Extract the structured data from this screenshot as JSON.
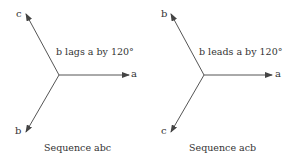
{
  "diagrams": [
    {
      "name": "sequence-abc",
      "caption": "Sequence abc",
      "annotation": "b lags a by 120°",
      "phasors": [
        {
          "label": "a",
          "angle_deg": 0
        },
        {
          "label": "c",
          "angle_deg": 120
        },
        {
          "label": "b",
          "angle_deg": 240
        }
      ]
    },
    {
      "name": "sequence-acb",
      "caption": "Sequence acb",
      "annotation": "b leads a by 120°",
      "phasors": [
        {
          "label": "a",
          "angle_deg": 0
        },
        {
          "label": "b",
          "angle_deg": 120
        },
        {
          "label": "c",
          "angle_deg": 240
        }
      ]
    }
  ],
  "colors": {
    "line": "#555555",
    "text": "#333333"
  }
}
